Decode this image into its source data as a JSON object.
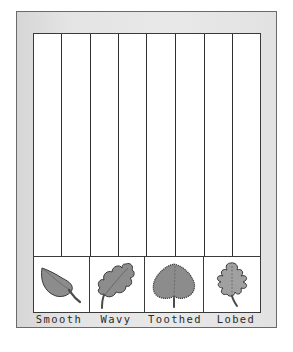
{
  "chart": {
    "columns": 8,
    "leaf_types": [
      {
        "label": "Smooth",
        "icon": "smooth-leaf-icon"
      },
      {
        "label": "Wavy",
        "icon": "wavy-leaf-icon"
      },
      {
        "label": "Toothed",
        "icon": "toothed-leaf-icon"
      },
      {
        "label": "Lobed",
        "icon": "lobed-leaf-icon"
      }
    ]
  },
  "colors": {
    "frame": "#e4e4e4",
    "frame_border": "#6a6a6a",
    "grid_line": "#2e2e2e",
    "leaf_fill": "#8c8c8c",
    "leaf_outline": "#3a3a3a"
  }
}
